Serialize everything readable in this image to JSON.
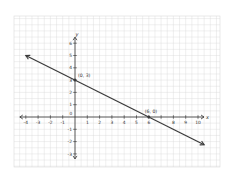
{
  "chart_data": {
    "type": "line",
    "title": "",
    "xlabel": "x",
    "ylabel": "y",
    "xlim": [
      -4,
      10
    ],
    "ylim": [
      -3,
      6
    ],
    "grid": true,
    "x_ticks": [
      -4,
      -3,
      -2,
      -1,
      0,
      1,
      2,
      3,
      4,
      5,
      6,
      7,
      8,
      9,
      10
    ],
    "x_tick_labels": [
      "-4",
      "-3",
      "-2",
      "-1",
      "0",
      "1",
      "2",
      "3",
      "4",
      "5",
      "6",
      "",
      "8",
      "9",
      "10"
    ],
    "y_ticks": [
      -3,
      -2,
      -1,
      1,
      2,
      3,
      4,
      5,
      6
    ],
    "y_tick_labels": [
      "-3",
      "-2",
      "-1",
      "1",
      "2",
      "3",
      "4",
      "5",
      "6"
    ],
    "series": [
      {
        "name": "line",
        "equation": "y = -x/2 + 3",
        "x": [
          -4.0,
          10.5
        ],
        "y": [
          5.0,
          -2.25
        ],
        "arrows": "both"
      }
    ],
    "points": [
      {
        "x": 0,
        "y": 3,
        "label": "(0, 3)"
      },
      {
        "x": 6,
        "y": 0,
        "label": "(6, 0)"
      }
    ],
    "colors": {
      "line": "#3a3a3a",
      "axis": "#333333",
      "grid": "#d9d9d9",
      "background": "#ffffff"
    }
  }
}
